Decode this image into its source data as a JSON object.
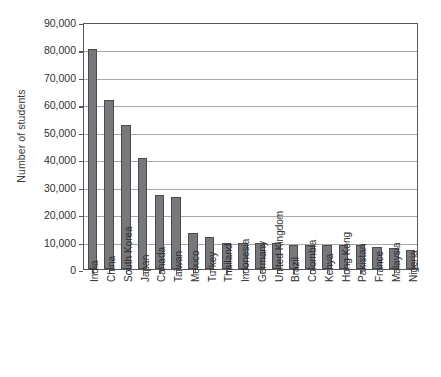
{
  "chart_data": {
    "type": "bar",
    "title": "",
    "xlabel": "",
    "ylabel": "Number of students",
    "ylim": [
      0,
      90000
    ],
    "ytick_values": [
      90000,
      80000,
      70000,
      60000,
      50000,
      40000,
      30000,
      20000,
      10000,
      0
    ],
    "ytick_labels": [
      "90,000",
      "80,000",
      "70,000",
      "60,000",
      "50,000",
      "40,000",
      "30,000",
      "20,000",
      "10,000",
      "0"
    ],
    "grid": "horizontal",
    "legend": "none",
    "orientation": "vertical",
    "bar_color": "#77787b",
    "bar_edge_color": "#4a4b4d",
    "gridline_color": "#a7a9ac",
    "axis_color": "#58595b",
    "categories": [
      "India",
      "China",
      "South Korea",
      "Japan",
      "Canada",
      "Taiwan",
      "Mexico",
      "Turkey",
      "Thailand",
      "Indonesia",
      "Germany",
      "United Kingdom",
      "Brazil",
      "Colombia",
      "Kenya",
      "Hong Kong",
      "Pakistan",
      "France",
      "Malaysia",
      "Nigeria"
    ],
    "values": [
      80000,
      61500,
      52400,
      40600,
      26800,
      26200,
      13000,
      11500,
      9400,
      9400,
      9400,
      9300,
      8800,
      8700,
      8700,
      8600,
      8600,
      8100,
      7500,
      7000
    ]
  },
  "caption": {
    "text": ""
  }
}
